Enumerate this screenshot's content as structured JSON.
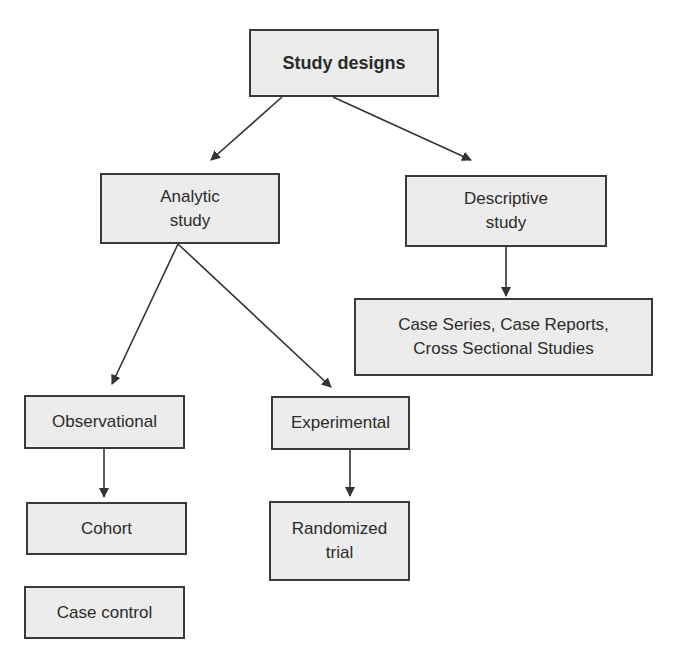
{
  "diagram": {
    "title": "Study designs",
    "nodes": [
      {
        "id": "root",
        "label": "Study designs"
      },
      {
        "id": "analytic",
        "label": "Analytic\nstudy"
      },
      {
        "id": "descriptive",
        "label": "Descriptive\nstudy"
      },
      {
        "id": "descriptive_types",
        "label": "Case Series, Case Reports,\nCross Sectional Studies"
      },
      {
        "id": "observational",
        "label": "Observational"
      },
      {
        "id": "experimental",
        "label": "Experimental"
      },
      {
        "id": "cohort",
        "label": "Cohort"
      },
      {
        "id": "randomized",
        "label": "Randomized\ntrial"
      },
      {
        "id": "case_control",
        "label": "Case control"
      }
    ],
    "edges": [
      {
        "from": "root",
        "to": "analytic"
      },
      {
        "from": "root",
        "to": "descriptive"
      },
      {
        "from": "descriptive",
        "to": "descriptive_types"
      },
      {
        "from": "analytic",
        "to": "observational"
      },
      {
        "from": "analytic",
        "to": "experimental"
      },
      {
        "from": "observational",
        "to": "cohort"
      },
      {
        "from": "experimental",
        "to": "randomized"
      }
    ],
    "colors": {
      "box_fill": "#ececec",
      "box_border": "#3a3a3a",
      "arrow": "#333333"
    }
  }
}
